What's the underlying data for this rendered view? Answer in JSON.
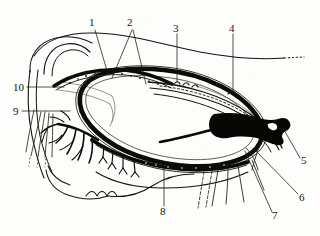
{
  "figure": {
    "kind": "scanned-anatomical-line-drawing",
    "caption": "",
    "background_color": "#fdfdfc",
    "ink_color": "#100d0a",
    "label_color": "#15120f"
  },
  "labels": [
    {
      "id": "1",
      "text": "1",
      "x": 92,
      "y": 22,
      "leader_to": [
        [
          108,
          74
        ]
      ]
    },
    {
      "id": "2",
      "text": "2",
      "x": 130,
      "y": 22,
      "leader_to": [
        [
          112,
          78
        ],
        [
          145,
          84
        ]
      ]
    },
    {
      "id": "3",
      "text": "3",
      "x": 175,
      "y": 28,
      "leader_to": [
        [
          177,
          82
        ]
      ]
    },
    {
      "id": "4",
      "text": "4",
      "x": 232,
      "y": 28,
      "leader_to": [
        [
          232,
          90
        ]
      ]
    },
    {
      "id": "5",
      "text": "5",
      "x": 303,
      "y": 160,
      "leader_to": [
        [
          283,
          128
        ]
      ]
    },
    {
      "id": "6",
      "text": "6",
      "x": 302,
      "y": 197,
      "leader_to": [
        [
          255,
          150
        ]
      ]
    },
    {
      "id": "7",
      "text": "7",
      "x": 275,
      "y": 215,
      "leader_to": [
        [
          246,
          152
        ]
      ]
    },
    {
      "id": "8",
      "text": "8",
      "x": 161,
      "y": 211,
      "leader_to": [
        [
          164,
          170
        ]
      ]
    },
    {
      "id": "9",
      "text": "9",
      "x": 14,
      "y": 111,
      "leader_to": [
        [
          70,
          114
        ]
      ]
    },
    {
      "id": "10",
      "text": "10",
      "x": 14,
      "y": 86,
      "leader_to": [
        [
          62,
          90
        ]
      ]
    }
  ],
  "label_count": 10
}
